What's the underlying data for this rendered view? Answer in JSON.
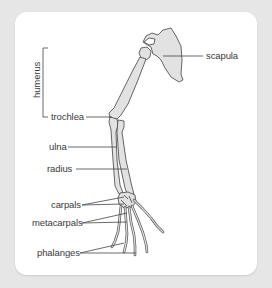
{
  "diagram": {
    "colors": {
      "background": "#e6e6e6",
      "card": "#ffffff",
      "bone_fill": "#e2e2e2",
      "bone_stroke": "#555555",
      "leader_line": "#444444",
      "text": "#3a3a3a"
    },
    "labels": {
      "scapula": "scapula",
      "humerus": "humerus",
      "trochlea": "trochlea",
      "ulna": "ulna",
      "radius": "radius",
      "carpals": "carpals",
      "metacarpals": "metacarpals",
      "phalanges": "phalanges"
    }
  }
}
